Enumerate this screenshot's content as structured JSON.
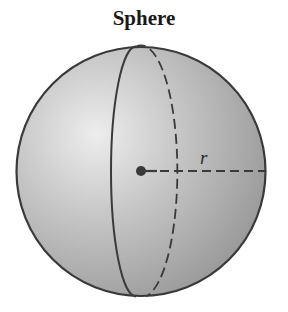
{
  "figure": {
    "title": "Sphere",
    "radius_label": "r"
  },
  "colors": {
    "outline": "#3a3a3a",
    "fill_light": "#e6e6e6",
    "fill_dark": "#9a9a9a",
    "background": "#ffffff"
  }
}
